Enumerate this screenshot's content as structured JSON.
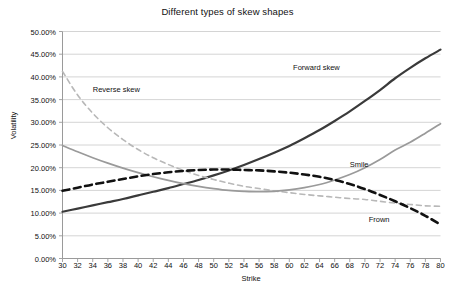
{
  "chart_data": {
    "type": "line",
    "title": "Different types of skew shapes",
    "xlabel": "Strike",
    "ylabel": "Volatility",
    "xlim": [
      30,
      80
    ],
    "ylim": [
      0,
      50
    ],
    "grid": true,
    "legend_position": "inline-annotations",
    "y_tick_labels": [
      "0.00%",
      "5.00%",
      "10.00%",
      "15.00%",
      "20.00%",
      "25.00%",
      "30.00%",
      "35.00%",
      "40.00%",
      "45.00%",
      "50.00%"
    ],
    "y_tick_values": [
      0,
      5,
      10,
      15,
      20,
      25,
      30,
      35,
      40,
      45,
      50
    ],
    "x_tick_labels": [
      "30",
      "32",
      "34",
      "36",
      "38",
      "40",
      "42",
      "44",
      "46",
      "48",
      "50",
      "52",
      "54",
      "56",
      "58",
      "60",
      "62",
      "64",
      "66",
      "68",
      "70",
      "72",
      "74",
      "76",
      "78",
      "80"
    ],
    "x": [
      30,
      32,
      34,
      36,
      38,
      40,
      42,
      44,
      46,
      48,
      50,
      52,
      54,
      56,
      58,
      60,
      62,
      64,
      66,
      68,
      70,
      72,
      74,
      76,
      78,
      80
    ],
    "series": [
      {
        "name": "Forward skew",
        "color": "#3a3a3a",
        "style": "solid",
        "width": 2.2,
        "label_x": 60.5,
        "label_y": 42.0,
        "values": [
          10.3,
          11.0,
          11.7,
          12.4,
          13.1,
          13.9,
          14.7,
          15.5,
          16.4,
          17.3,
          18.3,
          19.4,
          20.6,
          21.9,
          23.3,
          24.8,
          26.5,
          28.3,
          30.3,
          32.4,
          34.7,
          37.1,
          39.7,
          42.0,
          44.1,
          46.0
        ]
      },
      {
        "name": "Reverse skew",
        "color": "#b8b8b8",
        "style": "dashed",
        "width": 1.6,
        "label_x": 34.0,
        "label_y": 37.2,
        "values": [
          41.2,
          36.0,
          32.0,
          28.8,
          26.2,
          24.0,
          22.2,
          20.7,
          19.4,
          18.3,
          17.4,
          16.6,
          15.9,
          15.4,
          14.9,
          14.5,
          14.1,
          13.8,
          13.5,
          13.2,
          13.0,
          12.6,
          12.2,
          11.9,
          11.6,
          11.5
        ]
      },
      {
        "name": "Smile",
        "color": "#9a9a9a",
        "style": "solid",
        "width": 1.7,
        "label_x": 68.0,
        "label_y": 20.5,
        "values": [
          24.9,
          23.5,
          22.2,
          21.0,
          19.9,
          18.9,
          18.0,
          17.2,
          16.5,
          15.9,
          15.4,
          15.0,
          14.8,
          14.7,
          14.8,
          15.1,
          15.6,
          16.3,
          17.3,
          18.5,
          20.0,
          21.8,
          23.9,
          25.6,
          27.6,
          29.7
        ]
      },
      {
        "name": "Frown",
        "color": "#111111",
        "style": "dashed-bold",
        "width": 2.6,
        "label_x": 70.5,
        "label_y": 8.4,
        "values": [
          14.9,
          15.6,
          16.3,
          16.9,
          17.5,
          18.1,
          18.6,
          19.0,
          19.3,
          19.5,
          19.6,
          19.6,
          19.5,
          19.4,
          19.2,
          18.9,
          18.5,
          18.0,
          17.3,
          16.4,
          15.3,
          14.0,
          12.6,
          11.1,
          9.4,
          7.5
        ]
      }
    ]
  }
}
